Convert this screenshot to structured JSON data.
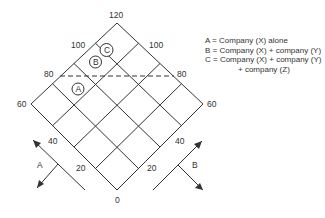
{
  "diagram": {
    "axis_labels": {
      "top": "120",
      "left": "60",
      "right": "60",
      "bottom": "0",
      "upper_left_100": "100",
      "upper_left_80": "80",
      "upper_right_100": "100",
      "upper_right_80": "80",
      "lower_left_40": "40",
      "lower_left_20": "20",
      "lower_right_40": "40",
      "lower_right_20": "20"
    },
    "markers": [
      {
        "id": "A",
        "label": "A"
      },
      {
        "id": "B",
        "label": "B"
      },
      {
        "id": "C",
        "label": "C"
      }
    ],
    "axis_arrows": {
      "left": "A",
      "right": "B"
    },
    "threshold_line": {
      "value": "80",
      "style": "dashed"
    },
    "colors": {
      "line": "#333333",
      "text": "#333333",
      "background": "#ffffff"
    }
  },
  "legend": {
    "items": [
      {
        "key": "A",
        "text": "A = Company (X) alone"
      },
      {
        "key": "B",
        "text": "B = Company (X) + company (Y)"
      },
      {
        "key": "C",
        "text": "C = Company (X) + company (Y)",
        "continuation": "+ company (Z)"
      }
    ]
  }
}
